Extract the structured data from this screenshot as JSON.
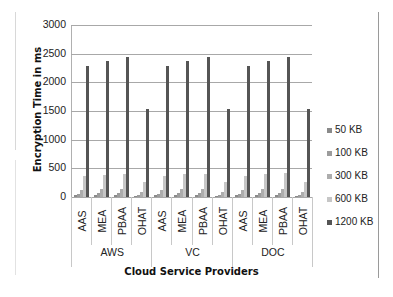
{
  "chart_data": {
    "type": "bar",
    "title": "",
    "xlabel": "Cloud Service Providers",
    "ylabel": "Encryption Time in ms",
    "ylim": [
      0,
      3000
    ],
    "yticks": [
      0,
      500,
      1000,
      1500,
      2000,
      2500,
      3000
    ],
    "grid": true,
    "legend_position": "right",
    "groups": [
      "AWS",
      "VC",
      "DOC"
    ],
    "categories": [
      "AAS",
      "MEA",
      "PBAA",
      "OHAT",
      "AAS",
      "MEA",
      "PBAA",
      "OHAT",
      "AAS",
      "MEA",
      "PBAA",
      "OHAT"
    ],
    "series": [
      {
        "name": "50 KB",
        "color": "#8a8a8a",
        "values": [
          30,
          35,
          35,
          20,
          30,
          35,
          35,
          20,
          30,
          35,
          35,
          20
        ]
      },
      {
        "name": "100 KB",
        "color": "#9c9c9c",
        "values": [
          60,
          70,
          70,
          40,
          60,
          70,
          70,
          40,
          60,
          70,
          70,
          40
        ]
      },
      {
        "name": "300 KB",
        "color": "#adadad",
        "values": [
          130,
          140,
          140,
          90,
          130,
          140,
          140,
          90,
          130,
          140,
          140,
          90
        ]
      },
      {
        "name": "600 KB",
        "color": "#c6c6c6",
        "values": [
          370,
          390,
          410,
          270,
          370,
          400,
          410,
          270,
          370,
          400,
          420,
          270
        ]
      },
      {
        "name": "1200 KB",
        "color": "#555555",
        "values": [
          2280,
          2370,
          2440,
          1530,
          2280,
          2370,
          2440,
          1530,
          2280,
          2370,
          2450,
          1540
        ]
      }
    ]
  },
  "axis": {
    "ytick_labels": [
      "3000",
      "2500",
      "2000",
      "1500",
      "1000",
      "500",
      "0"
    ],
    "ylabel": "Encryption Time in ms",
    "xlabel": "Cloud Service Providers",
    "category_labels": [
      "AAS",
      "MEA",
      "PBAA",
      "OHAT",
      "AAS",
      "MEA",
      "PBAA",
      "OHAT",
      "AAS",
      "MEA",
      "PBAA",
      "OHAT"
    ],
    "group_labels": [
      "AWS",
      "VC",
      "DOC"
    ]
  },
  "legend": {
    "items": [
      {
        "label": "50 KB",
        "color": "#8a8a8a"
      },
      {
        "label": "100 KB",
        "color": "#9c9c9c"
      },
      {
        "label": "300 KB",
        "color": "#adadad"
      },
      {
        "label": "600 KB",
        "color": "#c6c6c6"
      },
      {
        "label": "1200 KB",
        "color": "#555555"
      }
    ]
  }
}
